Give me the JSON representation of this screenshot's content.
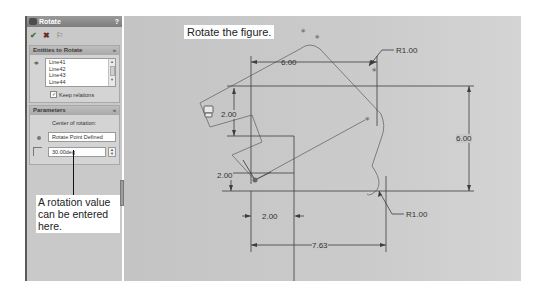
{
  "panel": {
    "title": "Rotate",
    "help_label": "?",
    "toolbar": {
      "ok_icon": "✔",
      "cancel_icon": "✖",
      "pin_icon": "⚐"
    },
    "entities_group": {
      "header": "Entities to Rotate",
      "collapse_icon": "»",
      "items": [
        "Line41",
        "Line42",
        "Line43",
        "Line44"
      ],
      "keep_relations_label": "Keep relations",
      "keep_relations_checked": true,
      "check_mark": "✓"
    },
    "parameters_group": {
      "header": "Parameters",
      "collapse_icon": "»",
      "center_label": "Center of rotation:",
      "center_value": "Rotate Point Defined",
      "angle_value": "30.00deg",
      "spinner_up": "▲",
      "spinner_down": "▼"
    }
  },
  "callouts": {
    "panel_callout": "A rotation value can be entered here.",
    "canvas_callout": "Rotate the figure."
  },
  "dimensions": {
    "top_width": "6.00",
    "top_radius": "R1.00",
    "right_height": "6.00",
    "left_upper_height": "2.00",
    "left_lower_height": "2.00",
    "bottom_offset": "2.00",
    "bottom_width": "7.63",
    "bottom_radius": "R1.00"
  },
  "colors": {
    "canvas_bg": "#c8c8c8",
    "sketch_line": "#7a7a7a",
    "dim_line": "#333333",
    "panel_bg": "#c9c9c9"
  }
}
